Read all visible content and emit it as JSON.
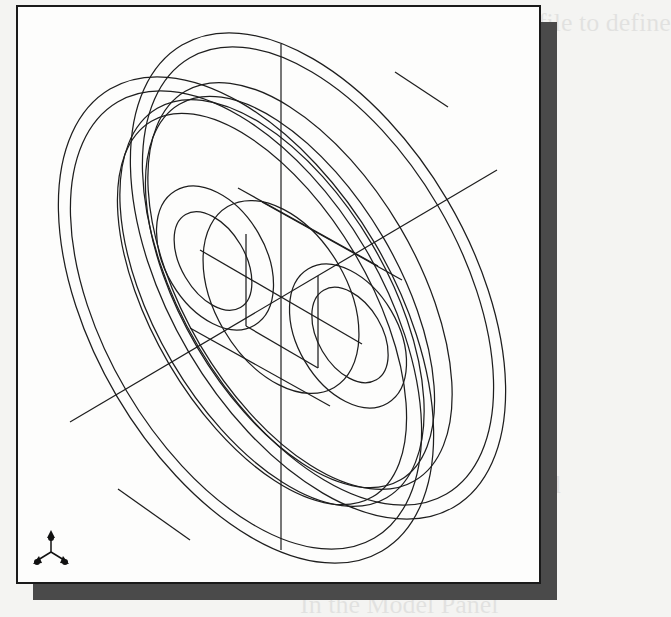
{
  "figure": {
    "view_mode": "wireframe",
    "projection": "isometric",
    "colors": {
      "background": "#fdfdfc",
      "line": "#1e1e1e",
      "frame_border": "#1a1a1a",
      "shadow": "#4a4a4a"
    },
    "triad": {
      "icon": "coordinate-triad-icon",
      "position": "bottom-left"
    }
  },
  "ghost_text": {
    "line1": "message: Select Profile to define",
    "line2": "feature.",
    "line3": "In the graphics",
    "line4": "option menu.",
    "line5": "the command",
    "line6": "In the Model Panel"
  }
}
